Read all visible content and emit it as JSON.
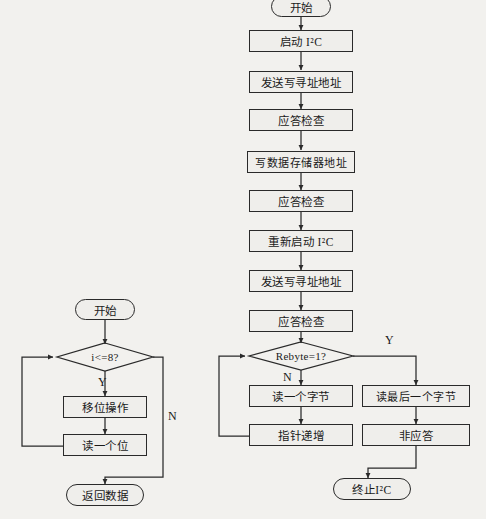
{
  "figure": {
    "background_color": "#f2f1ee",
    "stroke_color": "#2a2a2a",
    "box_fill": "#efeeeb"
  },
  "left_flowchart": {
    "name": "read-one-byte-flowchart",
    "nodes": [
      {
        "id": "l-start",
        "type": "terminator",
        "label": "开始"
      },
      {
        "id": "l-cond",
        "type": "decision",
        "label": "i<=8?"
      },
      {
        "id": "l-shift",
        "type": "process",
        "label": "移位操作"
      },
      {
        "id": "l-readbit",
        "type": "process",
        "label": "读一个位"
      },
      {
        "id": "l-return",
        "type": "terminator",
        "label": "返回数据"
      }
    ],
    "edge_labels": {
      "yes": "Y",
      "no": "N"
    }
  },
  "right_flowchart": {
    "name": "i2c-read-sequence-flowchart",
    "nodes": [
      {
        "id": "r-start",
        "type": "terminator",
        "label": "开始"
      },
      {
        "id": "r-init",
        "type": "process",
        "label": "启动 I²C"
      },
      {
        "id": "r-addr1",
        "type": "process",
        "label": "发送写寻址地址"
      },
      {
        "id": "r-ack1",
        "type": "process",
        "label": "应答检查"
      },
      {
        "id": "r-memaddr",
        "type": "process",
        "label": "写数据存储器地址"
      },
      {
        "id": "r-ack2",
        "type": "process",
        "label": "应答检查"
      },
      {
        "id": "r-restart",
        "type": "process",
        "label": "重新启动 I²C"
      },
      {
        "id": "r-addr2",
        "type": "process",
        "label": "发送写寻址地址"
      },
      {
        "id": "r-ack3",
        "type": "process",
        "label": "应答检查"
      },
      {
        "id": "r-cond",
        "type": "decision",
        "label": "Rebyte=1?"
      },
      {
        "id": "r-readone",
        "type": "process",
        "label": "读一个字节"
      },
      {
        "id": "r-ptr",
        "type": "process",
        "label": "指针递增"
      },
      {
        "id": "r-readlast",
        "type": "process",
        "label": "读最后一个字节"
      },
      {
        "id": "r-nack",
        "type": "process",
        "label": "非应答"
      },
      {
        "id": "r-stop",
        "type": "terminator",
        "label": "终止I²C"
      }
    ],
    "edge_labels": {
      "yes": "Y",
      "no": "N"
    }
  }
}
